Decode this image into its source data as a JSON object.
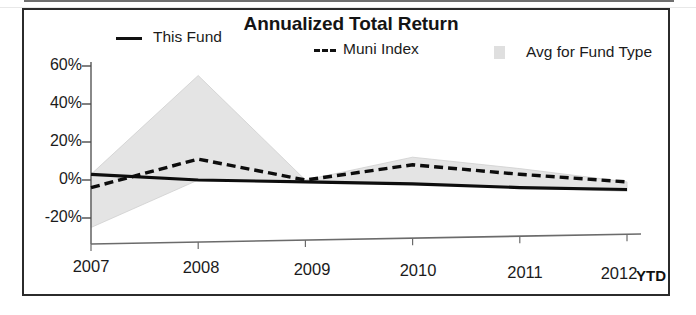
{
  "chart_data": {
    "type": "line",
    "title": "Annualized Total Return",
    "xlabel": "",
    "ylabel": "",
    "x": [
      "2007",
      "2008",
      "2009",
      "2010",
      "2011",
      "2012"
    ],
    "x_tick_labels": [
      "2007",
      "2008",
      "2009",
      "2010",
      "2011",
      "2012"
    ],
    "x_axis_suffix": "YTD",
    "y_tick_labels": [
      "60%",
      "40%",
      "20%",
      "0%",
      "-20%"
    ],
    "y_tick_values": [
      60,
      40,
      20,
      0,
      -20
    ],
    "ylim": [
      -30,
      62
    ],
    "grid": false,
    "legend_position": "top",
    "series": [
      {
        "name": "This Fund",
        "style": "solid",
        "color": "#111111",
        "values": [
          3,
          0,
          -1,
          -2,
          -4,
          -5
        ]
      },
      {
        "name": "Muni Index",
        "style": "dashed",
        "color": "#111111",
        "values": [
          -4,
          11,
          0,
          8,
          3,
          -1
        ]
      },
      {
        "name": "Avg for Fund Type",
        "style": "band",
        "color": "#e2e2e2",
        "band_upper": [
          3,
          55,
          0,
          12,
          6,
          -1
        ],
        "band_lower": [
          -25,
          0,
          -1,
          -2,
          -4,
          -6
        ]
      }
    ],
    "legend": [
      {
        "label": "This Fund",
        "marker": "solid-line"
      },
      {
        "label": "Muni Index",
        "marker": "dashed-line"
      },
      {
        "label": "Avg for Fund Type",
        "marker": "area-swatch"
      }
    ]
  }
}
